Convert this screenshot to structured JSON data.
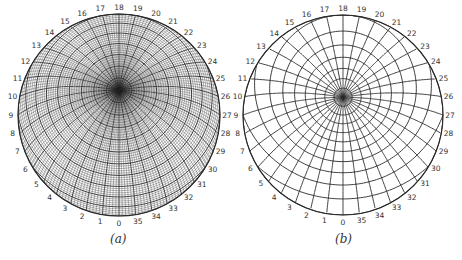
{
  "header": {
    "running_title": "STEREOGRAPHIC NETS",
    "page_number": "53"
  },
  "figures": [
    {
      "id": "a",
      "caption": "(a)",
      "net_type": "equal-area",
      "center": [
        119,
        115
      ],
      "radius": 101,
      "grid_step_deg": 2,
      "major_step_deg": 10,
      "line_color": "#2a2a2a",
      "rim_labels": [
        "0",
        "1",
        "2",
        "3",
        "4",
        "5",
        "6",
        "7",
        "8",
        "9",
        "10",
        "11",
        "12",
        "13",
        "14",
        "15",
        "16",
        "17",
        "18",
        "19",
        "20",
        "21",
        "22",
        "23",
        "24",
        "25",
        "26",
        "27",
        "28",
        "29",
        "30",
        "31",
        "32",
        "33",
        "34",
        "35"
      ]
    },
    {
      "id": "b",
      "caption": "(b)",
      "net_type": "stereographic",
      "center": [
        343,
        115
      ],
      "radius": 100,
      "grid_step_deg": 10,
      "major_step_deg": 10,
      "line_color": "#2a2a2a",
      "rim_labels": [
        "0",
        "1",
        "2",
        "3",
        "4",
        "5",
        "6",
        "7",
        "8",
        "9",
        "10",
        "11",
        "12",
        "13",
        "14",
        "15",
        "16",
        "17",
        "18",
        "19",
        "20",
        "21",
        "22",
        "23",
        "24",
        "25",
        "26",
        "27",
        "28",
        "29",
        "30",
        "31",
        "32",
        "33",
        "34",
        "35"
      ]
    }
  ],
  "captions": {
    "a": "(a)",
    "b": "(b)"
  }
}
